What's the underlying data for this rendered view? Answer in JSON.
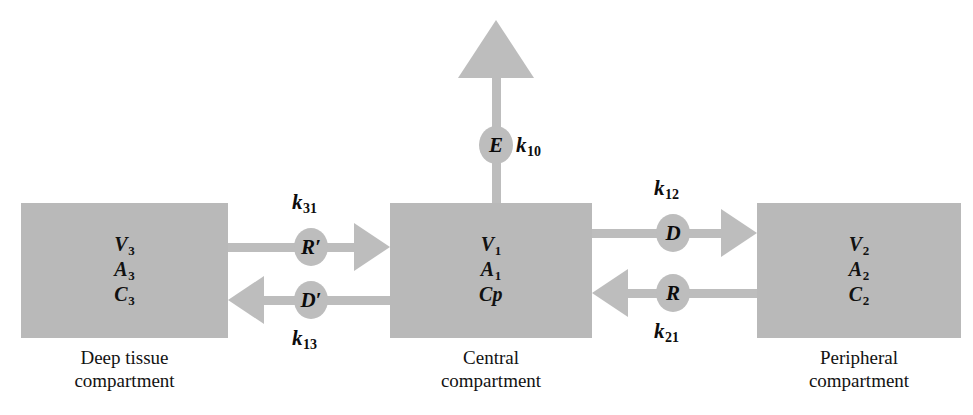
{
  "diagram": {
    "colors": {
      "fill": "#b9b9b9",
      "connector": "#bdbdbd",
      "text": "#111111",
      "background": "#ffffff"
    },
    "compartments": [
      {
        "id": "deep-tissue",
        "caption": "Deep tissue\ncompartment",
        "volume": "V",
        "volume_sub": "3",
        "amount": "A",
        "amount_sub": "3",
        "concentration": "C",
        "concentration_sub": "3"
      },
      {
        "id": "central",
        "caption": "Central\ncompartment",
        "volume": "V",
        "volume_sub": "1",
        "amount": "A",
        "amount_sub": "1",
        "concentration": "Cp",
        "concentration_sub": ""
      },
      {
        "id": "peripheral",
        "caption": "Peripheral\ncompartment",
        "volume": "V",
        "volume_sub": "2",
        "amount": "A",
        "amount_sub": "2",
        "concentration": "C",
        "concentration_sub": "2"
      }
    ],
    "nodes": [
      {
        "id": "node-r-prime",
        "label": "R′",
        "meaning": "redistribution-from-deep-tissue"
      },
      {
        "id": "node-d-prime",
        "label": "D′",
        "meaning": "distribution-to-deep-tissue"
      },
      {
        "id": "node-d",
        "label": "D",
        "meaning": "distribution-to-peripheral"
      },
      {
        "id": "node-r",
        "label": "R",
        "meaning": "redistribution-from-peripheral"
      },
      {
        "id": "node-e",
        "label": "E",
        "meaning": "elimination"
      }
    ],
    "rate_constants": [
      {
        "id": "k31",
        "base": "k",
        "sub": "31",
        "describes": "deep tissue to central"
      },
      {
        "id": "k13",
        "base": "k",
        "sub": "13",
        "describes": "central to deep tissue"
      },
      {
        "id": "k12",
        "base": "k",
        "sub": "12",
        "describes": "central to peripheral"
      },
      {
        "id": "k21",
        "base": "k",
        "sub": "21",
        "describes": "peripheral to central"
      },
      {
        "id": "k10",
        "base": "k",
        "sub": "10",
        "describes": "elimination from central"
      }
    ]
  }
}
